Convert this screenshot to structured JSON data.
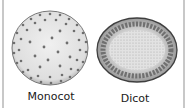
{
  "figure": {
    "panels": [
      {
        "label": "Monocot",
        "type": "scattered vascular bundles"
      },
      {
        "label": "Dicot",
        "type": "vascular bundles in a ring"
      }
    ]
  },
  "colors": {
    "bundle": "#6e6e6e",
    "outline": "#4a4a4a",
    "ground": "#eaeaea",
    "border": "#c8c8c8"
  }
}
